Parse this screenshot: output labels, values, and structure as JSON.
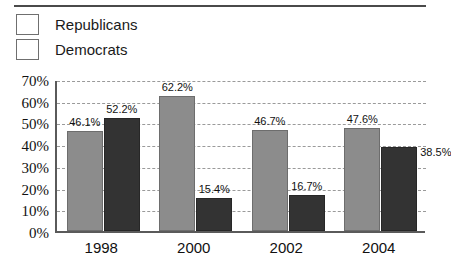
{
  "chart_data": {
    "type": "bar",
    "title": "",
    "xlabel": "",
    "ylabel": "",
    "categories": [
      "1998",
      "2000",
      "2002",
      "2004"
    ],
    "series": [
      {
        "name": "Republicans",
        "color": "#8c8c8c",
        "values": [
          46.1,
          62.2,
          46.7,
          47.6
        ],
        "labels": [
          "46.1%",
          "62.2%",
          "46.7%",
          "47.6%"
        ]
      },
      {
        "name": "Democrats",
        "color": "#333333",
        "values": [
          52.2,
          15.4,
          16.7,
          38.5
        ],
        "labels": [
          "52.2%",
          "15.4%",
          "16.7%",
          "38.5%"
        ]
      }
    ],
    "ylim": [
      0,
      70
    ],
    "ytick_values": [
      0,
      10,
      20,
      30,
      40,
      50,
      60,
      70
    ],
    "ytick_labels": [
      "0%",
      "10%",
      "20%",
      "30%",
      "40%",
      "50%",
      "60%",
      "70%"
    ],
    "grid": true,
    "grid_style": "dashed-horizontal",
    "legend_position": "top-left"
  },
  "legend": {
    "items": [
      {
        "label": "Republicans",
        "swatch_name": "legend-swatch-republicans"
      },
      {
        "label": "Democrats",
        "swatch_name": "legend-swatch-democrats"
      }
    ]
  }
}
